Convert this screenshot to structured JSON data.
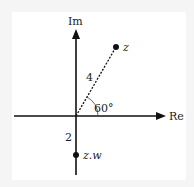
{
  "diagram": {
    "type": "argand-diagram",
    "axes": {
      "horizontal_label": "Re",
      "vertical_label": "Im"
    },
    "points": [
      {
        "label": "z",
        "modulus_label": "4",
        "angle_label": "60°"
      },
      {
        "label": "z.w",
        "modulus_label": "2"
      }
    ],
    "colors": {
      "background": "#f5f5f5",
      "panel": "#ffffff",
      "ink": "#111111"
    }
  }
}
